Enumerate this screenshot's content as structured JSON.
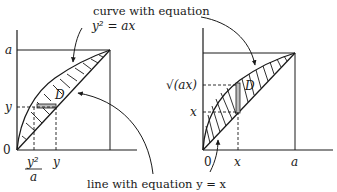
{
  "diagram": {
    "annotations": {
      "top_caption": "curve with equation",
      "top_equation": "y² = ax",
      "bottom_caption": "line with equation y = x"
    },
    "left_panel": {
      "y_axis_labels": {
        "top": "a",
        "mid": "y",
        "origin": "0"
      },
      "x_axis_labels": {
        "frac_num": "y²",
        "frac_den": "a",
        "x2": "y"
      },
      "region_label": "D",
      "strip_orientation": "horizontal"
    },
    "right_panel": {
      "y_axis_labels": {
        "upper": "√(ax)",
        "lower": "x"
      },
      "x_axis_labels": {
        "origin": "0",
        "x1": "x",
        "x2": "a"
      },
      "region_label": "D",
      "strip_orientation": "vertical"
    },
    "colors": {
      "ink": "#1a1a1a",
      "background": "#ffffff"
    }
  }
}
